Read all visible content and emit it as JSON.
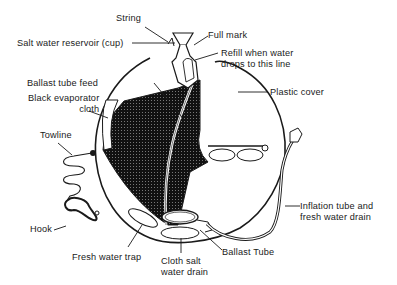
{
  "diagram": {
    "colors": {
      "line": "#1a1a1a",
      "cloth": "#111111",
      "background": "#ffffff"
    },
    "labels": {
      "string": "String",
      "salt_water_reservoir": "Salt water reservoir (cup)",
      "full_mark": "Full mark",
      "refill_line": "Refill when water\ndrops to this line",
      "ballast_tube_feed": "Ballast tube feed",
      "black_evaporator_cloth": "Black evaporator\ncloth",
      "plastic_cover": "Plastic cover",
      "towline": "Towline",
      "hook": "Hook",
      "inflation_tube": "Inflation tube and\nfresh water drain",
      "fresh_water_trap": "Fresh water trap",
      "cloth_salt_water_drain": "Cloth salt\nwater drain",
      "ballast_tube": "Ballast Tube"
    }
  }
}
